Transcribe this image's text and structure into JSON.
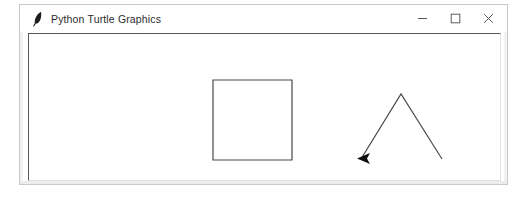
{
  "window": {
    "title": "Python Turtle Graphics",
    "icon": "turtle-feather-icon",
    "background_color": "#ffffff",
    "border_color": "#c8c8c8",
    "controls": [
      {
        "name": "minimize",
        "glyph": "–",
        "label": "Minimize"
      },
      {
        "name": "maximize",
        "glyph": "□",
        "label": "Maximize"
      },
      {
        "name": "close",
        "glyph": "×",
        "label": "Close"
      }
    ]
  },
  "canvas": {
    "background_color": "#ffffff",
    "border_color": "#585858",
    "width": 473,
    "height": 148,
    "shapes": [
      {
        "name": "square",
        "type": "polygon",
        "stroke": "#4a4a4a",
        "stroke_width": 1.2,
        "fill": "none",
        "points": "184,46 263,46 263,126 184,126"
      },
      {
        "name": "triangle",
        "type": "polygon",
        "stroke": "#4a4a4a",
        "stroke_width": 1.2,
        "fill": "none",
        "points": "332,125 372,60 413,125"
      }
    ],
    "turtle_cursor": {
      "name": "turtle-arrow-cursor",
      "type": "arrowhead",
      "fill": "#101010",
      "heading": "left",
      "points": "328,124.5 341,119 338,124.5 341,130"
    }
  }
}
